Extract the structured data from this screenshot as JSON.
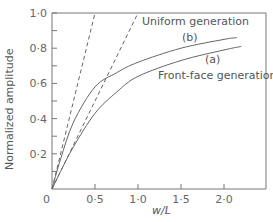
{
  "chart_data": {
    "type": "line",
    "title": "",
    "xlabel": "w/L",
    "ylabel": "Normalized amplitude",
    "xlim": [
      0,
      2.5
    ],
    "ylim": [
      0,
      1.0
    ],
    "xticks": [
      "0",
      "0·5",
      "1·0",
      "1·5",
      "2·0"
    ],
    "yticks": [
      "0·2",
      "0·4",
      "0·6",
      "0·8",
      "1·0"
    ],
    "grid": false,
    "annotations": [
      "Uniform generation",
      "(b)",
      "(a)",
      "Front-face generation"
    ],
    "series": [
      {
        "name": "Asymptote (b) dashed",
        "style": "dashed",
        "x": [
          0,
          0.5
        ],
        "y": [
          0,
          1.0
        ]
      },
      {
        "name": "Asymptote (a) dashed",
        "style": "dashed",
        "x": [
          0,
          1.0
        ],
        "y": [
          0,
          1.0
        ]
      },
      {
        "name": "(b) Uniform generation",
        "style": "solid",
        "x": [
          0,
          0.1,
          0.25,
          0.5,
          0.75,
          1.0,
          1.5,
          2.0,
          2.15
        ],
        "y": [
          0,
          0.17,
          0.38,
          0.58,
          0.66,
          0.72,
          0.8,
          0.85,
          0.86
        ]
      },
      {
        "name": "(a) Front-face generation",
        "style": "solid",
        "x": [
          0,
          0.1,
          0.25,
          0.5,
          0.75,
          1.0,
          1.5,
          2.0,
          2.2
        ],
        "y": [
          0,
          0.1,
          0.24,
          0.43,
          0.55,
          0.64,
          0.73,
          0.79,
          0.81
        ]
      }
    ]
  }
}
